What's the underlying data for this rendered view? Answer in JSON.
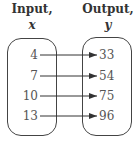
{
  "headers": {
    "input_label": "Input,",
    "input_var": "x",
    "output_label": "Output,",
    "output_var": "y"
  },
  "mapping": [
    {
      "input": "4",
      "output": "33"
    },
    {
      "input": "7",
      "output": "54"
    },
    {
      "input": "10",
      "output": "75"
    },
    {
      "input": "13",
      "output": "96"
    }
  ],
  "colors": {
    "stroke": "#444444",
    "text": "#555555",
    "header": "#333333"
  }
}
